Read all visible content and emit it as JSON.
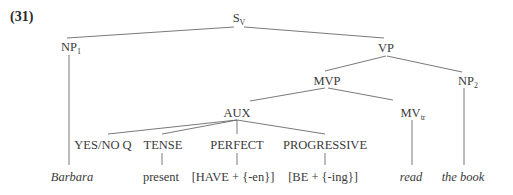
{
  "example_number": "(31)",
  "nodes": {
    "s": {
      "base": "S",
      "sub": "V"
    },
    "np1": {
      "base": "NP",
      "sub": "1"
    },
    "vp": {
      "base": "VP"
    },
    "mvp": {
      "base": "MVP"
    },
    "np2": {
      "base": "NP",
      "sub": "2"
    },
    "aux": {
      "base": "AUX"
    },
    "mv": {
      "base": "MV",
      "sub": "tr"
    },
    "yesno": {
      "base": "YES/NO Q"
    },
    "tense": {
      "base": "TENSE"
    },
    "perfect": {
      "base": "PERFECT"
    },
    "progressive": {
      "base": "PROGRESSIVE"
    }
  },
  "leaves": {
    "barbara": "Barbara",
    "present": "present",
    "have": "[HAVE + {-en}]",
    "be": "[BE + {-ing}]",
    "read": "read",
    "thebook": "the book"
  }
}
